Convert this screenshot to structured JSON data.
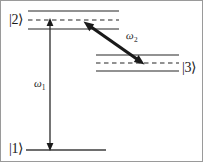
{
  "figure": {
    "background_color": "#ffffff",
    "border_color": "#9a9a9a",
    "line_color": "#6e6e6e",
    "arrow_color": "#1a1a1a",
    "width": 203,
    "height": 162
  },
  "levels": [
    {
      "id": "level-2",
      "label": "|2⟩",
      "label_position": "left",
      "solid_upper_y": 10,
      "dashed_y": 19,
      "solid_lower_y": 28,
      "x_start": 27,
      "x_end": 118
    },
    {
      "id": "level-3",
      "label": "|3⟩",
      "label_position": "right",
      "solid_upper_y": 54,
      "dashed_y": 62,
      "solid_lower_y": 70,
      "x_start": 95,
      "x_end": 178
    },
    {
      "id": "level-1",
      "label": "|1⟩",
      "label_position": "left",
      "solid_y": 149,
      "x_start": 25,
      "x_end": 105
    }
  ],
  "transitions": [
    {
      "id": "transition-omega1",
      "label": "ω",
      "label_subscript": "1",
      "orientation": "vertical",
      "double_headed": true,
      "from_level": "level-1",
      "to_level": "level-2",
      "x": 49,
      "y_top": 18,
      "y_bottom": 149
    },
    {
      "id": "transition-omega2",
      "label": "ω",
      "label_subscript": "2",
      "orientation": "diagonal",
      "double_headed": true,
      "from_level": "level-3",
      "to_level": "level-2",
      "x_top": 83,
      "y_top": 21,
      "x_bottom": 143,
      "y_bottom": 63
    }
  ]
}
